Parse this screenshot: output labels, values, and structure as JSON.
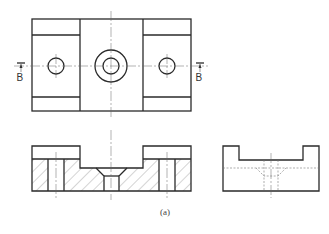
{
  "figure": {
    "caption": "(a)",
    "section_marker_left": "B",
    "section_marker_right": "B"
  },
  "views": [
    {
      "name": "top-view"
    },
    {
      "name": "front-section-view",
      "section": "B-B"
    },
    {
      "name": "side-view"
    }
  ]
}
